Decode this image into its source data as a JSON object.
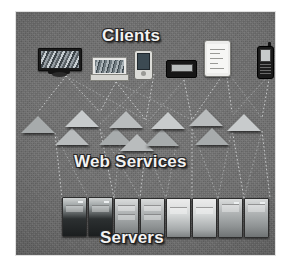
{
  "figure": {
    "type": "three-tier-architecture-photo-diagram",
    "background_color": "#6d6d6d",
    "plate": {
      "x": 16,
      "y": 12,
      "width": 259,
      "height": 243
    }
  },
  "tiers": [
    {
      "id": "clients",
      "label": "Clients",
      "color": "#f2f2f2",
      "y": 15
    },
    {
      "id": "web-services",
      "label": "Web Services",
      "color": "#f2f2f2",
      "y": 141
    },
    {
      "id": "servers",
      "label": "Servers",
      "color": "#f2f2f2",
      "y": 217
    }
  ],
  "clients": [
    {
      "name": "desktop-computer",
      "x": 38,
      "y": 36
    },
    {
      "name": "laptop-computer",
      "x": 89,
      "y": 47
    },
    {
      "name": "pda-handheld",
      "x": 125,
      "y": 38
    },
    {
      "name": "portable-device",
      "x": 156,
      "y": 47
    },
    {
      "name": "tablet-computer",
      "x": 196,
      "y": 30
    },
    {
      "name": "mobile-phone",
      "x": 245,
      "y": 34
    }
  ],
  "web_services": [
    {
      "name": "service-node-1",
      "x": 22,
      "y": 104,
      "shade": "dim"
    },
    {
      "name": "service-node-2",
      "x": 56,
      "y": 116,
      "shade": "normal"
    },
    {
      "name": "service-node-3",
      "x": 66,
      "y": 98,
      "shade": "bright"
    },
    {
      "name": "service-node-4",
      "x": 100,
      "y": 116,
      "shade": "dim"
    },
    {
      "name": "service-node-5",
      "x": 110,
      "y": 99,
      "shade": "normal"
    },
    {
      "name": "service-node-6",
      "x": 146,
      "y": 117,
      "shade": "dim"
    },
    {
      "name": "service-node-7",
      "x": 152,
      "y": 100,
      "shade": "bright"
    },
    {
      "name": "service-node-8",
      "x": 190,
      "y": 97,
      "shade": "normal"
    },
    {
      "name": "service-node-9",
      "x": 196,
      "y": 116,
      "shade": "dim"
    },
    {
      "name": "service-node-10",
      "x": 228,
      "y": 102,
      "shade": "bright"
    },
    {
      "name": "service-node-11",
      "x": 121,
      "y": 122,
      "shade": "normal"
    }
  ],
  "servers": [
    {
      "name": "server-rack-1",
      "x": 62,
      "y": 185,
      "style": "dark"
    },
    {
      "name": "server-rack-2",
      "x": 88,
      "y": 185,
      "style": "dark"
    },
    {
      "name": "server-rack-3",
      "x": 114,
      "y": 186,
      "style": "normal"
    },
    {
      "name": "server-rack-4",
      "x": 140,
      "y": 186,
      "style": "normal"
    },
    {
      "name": "server-rack-5",
      "x": 166,
      "y": 186,
      "style": "glow"
    },
    {
      "name": "server-rack-6",
      "x": 192,
      "y": 186,
      "style": "glow"
    },
    {
      "name": "server-rack-7",
      "x": 218,
      "y": 186,
      "style": "normal"
    },
    {
      "name": "server-rack-8",
      "x": 244,
      "y": 186,
      "style": "normal"
    }
  ],
  "connections": {
    "style": "dotted",
    "color": "#d8dadb",
    "client_to_service": [
      [
        50,
        64,
        22,
        100
      ],
      [
        50,
        64,
        84,
        100
      ],
      [
        50,
        64,
        130,
        108
      ],
      [
        100,
        70,
        84,
        100
      ],
      [
        100,
        70,
        130,
        108
      ],
      [
        100,
        70,
        176,
        108
      ],
      [
        138,
        62,
        130,
        108
      ],
      [
        138,
        62,
        84,
        112
      ],
      [
        168,
        68,
        176,
        108
      ],
      [
        168,
        68,
        130,
        112
      ],
      [
        210,
        58,
        216,
        100
      ],
      [
        210,
        58,
        176,
        108
      ],
      [
        210,
        58,
        246,
        106
      ],
      [
        254,
        62,
        246,
        106
      ],
      [
        254,
        62,
        216,
        104
      ]
    ],
    "service_to_server": [
      [
        39,
        121,
        72,
        186
      ],
      [
        39,
        121,
        46,
        186
      ],
      [
        84,
        117,
        98,
        186
      ],
      [
        84,
        117,
        124,
        186
      ],
      [
        130,
        133,
        124,
        186
      ],
      [
        130,
        133,
        150,
        186
      ],
      [
        176,
        117,
        176,
        186
      ],
      [
        176,
        117,
        202,
        186
      ],
      [
        216,
        117,
        228,
        186
      ],
      [
        216,
        117,
        202,
        186
      ],
      [
        246,
        119,
        254,
        186
      ],
      [
        246,
        119,
        228,
        186
      ],
      [
        104,
        133,
        98,
        186
      ],
      [
        160,
        134,
        150,
        186
      ]
    ]
  }
}
